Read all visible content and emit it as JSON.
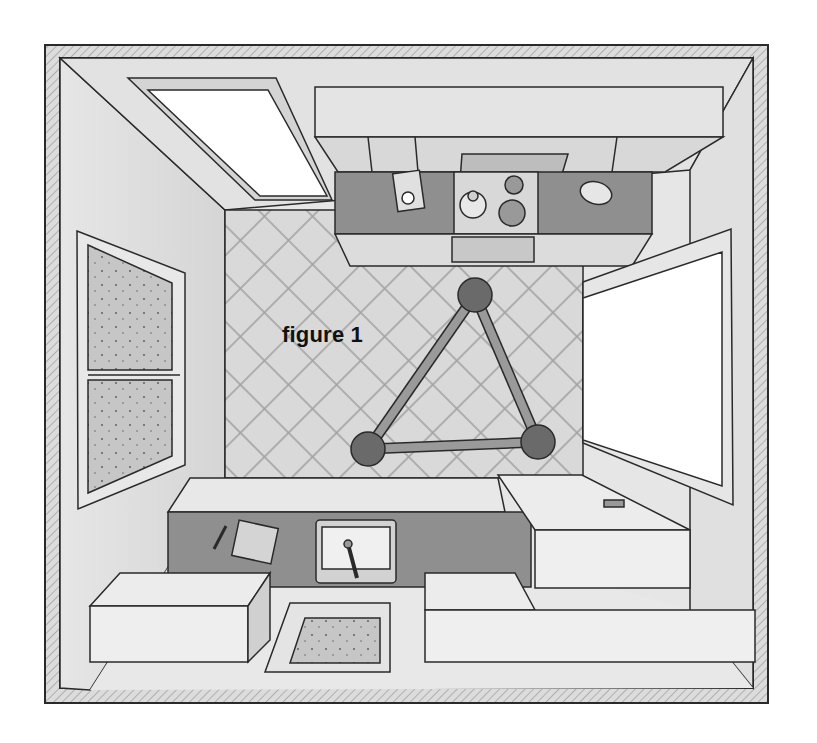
{
  "figure": {
    "label": "figure 1"
  },
  "colors": {
    "wall_hatch": "#c9c9c9",
    "wall_face": "#e4e4e4",
    "floor_tile": "#d6d6d6",
    "counter_top": "#8f8f8f",
    "cabinet": "#ececec",
    "window_glass": "#ffffff",
    "frosted_glass": "#c4c4c4",
    "triangle_node": "#6a6a6a",
    "triangle_bar": "#9a9a9a",
    "outline": "#2a2a2a"
  },
  "work_triangle": {
    "nodes": [
      {
        "name": "stove",
        "x": 475,
        "y": 295
      },
      {
        "name": "sink",
        "x": 368,
        "y": 449
      },
      {
        "name": "fridge-counter",
        "x": 538,
        "y": 442
      }
    ]
  }
}
